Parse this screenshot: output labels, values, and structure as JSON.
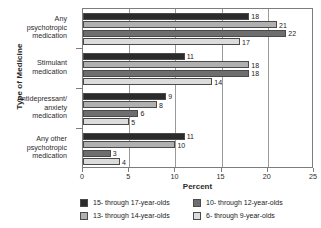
{
  "chart_data": {
    "type": "bar",
    "orientation": "horizontal",
    "title": "",
    "xlabel": "Percent",
    "ylabel": "Type of Medicine",
    "xlim": [
      0,
      25
    ],
    "xticks": [
      0,
      5,
      10,
      15,
      20,
      25
    ],
    "grid": true,
    "legend_position": "bottom",
    "categories": [
      "Any psychotropic medication",
      "Stimulant medication",
      "Antidepressant/ anxiety medication",
      "Any other psychotropic medication"
    ],
    "category_lines": [
      [
        "Any",
        "psychotropic",
        "medication"
      ],
      [
        "Stimulant",
        "medication"
      ],
      [
        "Antidepressant/",
        "anxiety",
        "medication"
      ],
      [
        "Any other",
        "psychotropic",
        "medication"
      ]
    ],
    "series": [
      {
        "name": "15- through 17-year-olds",
        "color": "#2b2b2b",
        "values": [
          18,
          11,
          9,
          11
        ]
      },
      {
        "name": "13- through 14-year-olds",
        "color": "#b0b0b0",
        "values": [
          21,
          18,
          8,
          10
        ]
      },
      {
        "name": "10- through 12-year-olds",
        "color": "#6e6e6e",
        "values": [
          22,
          18,
          6,
          3
        ]
      },
      {
        "name": "6- through 9-year-olds",
        "color": "#dcdcdc",
        "values": [
          17,
          14,
          5,
          4
        ]
      }
    ]
  },
  "axes": {
    "y_title": "Type of Medicine",
    "x_title": "Percent",
    "x_tick_labels": [
      "0",
      "5",
      "10",
      "15",
      "20",
      "25"
    ]
  },
  "legend": {
    "entries": [
      {
        "label": "15- through 17-year-olds",
        "color": "#2b2b2b"
      },
      {
        "label": "10- through 12-year-olds",
        "color": "#6e6e6e"
      },
      {
        "label": "13- through 14-year-olds",
        "color": "#b0b0b0"
      },
      {
        "label": "6- through 9-year-olds",
        "color": "#dcdcdc"
      }
    ]
  }
}
